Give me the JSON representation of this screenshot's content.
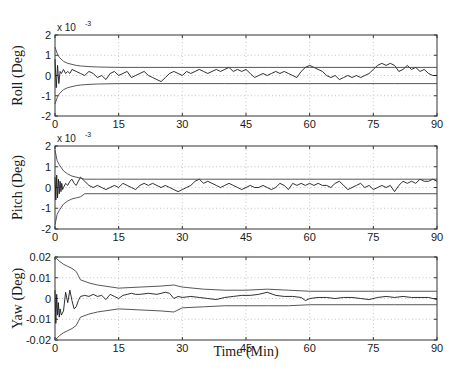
{
  "chart_data": {
    "type": "line",
    "title": "",
    "xlabel": "Time (Min)",
    "xlim": [
      0,
      90
    ],
    "xticks": [
      0,
      15,
      30,
      45,
      60,
      75,
      90
    ],
    "xtick_labels": [
      "0",
      "15",
      "30",
      "45",
      "60",
      "75",
      "90"
    ],
    "grid": true,
    "subplots": [
      {
        "name": "roll",
        "ylabel": "Roll (Deg)",
        "ylim": [
          -0.002,
          0.002
        ],
        "yticks": [
          -0.002,
          -0.001,
          0,
          0.001,
          0.002
        ],
        "ytick_labels": [
          "-2",
          "-1",
          "0",
          "1",
          "2"
        ],
        "exponent_label": "x 10",
        "exponent_power": "-3",
        "series": [
          {
            "name": "estimation error",
            "x": [
              0,
              0.3,
              0.6,
              0.9,
              1.2,
              1.5,
              2,
              2.5,
              3,
              3.5,
              4,
              5,
              6,
              7,
              8,
              9,
              10,
              11,
              12,
              13,
              14,
              15,
              16,
              17,
              18,
              19,
              20,
              21,
              22,
              23,
              24,
              25,
              26,
              27,
              28,
              29,
              30,
              31,
              32,
              33,
              34,
              35,
              36,
              37,
              38,
              39,
              40,
              41,
              42,
              43,
              44,
              45,
              46,
              47,
              48,
              49,
              50,
              51,
              52,
              53,
              54,
              55,
              56,
              57,
              58,
              59,
              60,
              61,
              62,
              63,
              64,
              65,
              66,
              67,
              68,
              69,
              70,
              71,
              72,
              73,
              74,
              75,
              76,
              77,
              78,
              79,
              80,
              81,
              82,
              83,
              84,
              85,
              86,
              87,
              88,
              89,
              90
            ],
            "y": [
              0.0008,
              -0.0006,
              0.0005,
              -0.0004,
              0.0002,
              0.0001,
              0.0003,
              0.0001,
              0.0002,
              0.0001,
              0.0003,
              0.0002,
              0.0001,
              0.0,
              0.0002,
              0.0001,
              -0.0001,
              0.0,
              -0.0002,
              0.0001,
              0.0002,
              0.0,
              0.0001,
              0.0002,
              -0.0001,
              0.0,
              0.0001,
              0.0002,
              0.0,
              -0.0001,
              -0.0002,
              -0.0003,
              -0.0001,
              0.0001,
              0.0002,
              0.0001,
              0.0,
              0.0002,
              0.0001,
              0.0002,
              0.0003,
              0.0002,
              0.0001,
              0.0002,
              0.0003,
              0.0002,
              0.0003,
              0.0004,
              0.0002,
              0.0003,
              0.0002,
              0.0003,
              0.0001,
              -0.0001,
              0.0,
              0.0001,
              0.0,
              0.0001,
              0.0002,
              0.0001,
              0.0002,
              0.0001,
              0.0,
              -0.0001,
              0.0002,
              0.0004,
              0.0005,
              0.0004,
              0.0003,
              0.0002,
              0.0,
              -0.0001,
              0.0,
              -0.0002,
              -0.0001,
              0.0,
              -0.0001,
              0.0,
              -0.0001,
              0.0,
              0.0001,
              0.0003,
              0.0005,
              0.0006,
              0.0005,
              0.0006,
              0.0005,
              0.0002,
              0.0003,
              0.0005,
              0.0003,
              0.0004,
              0.0002,
              0.0003,
              0.0001,
              0.0,
              0.0
            ]
          },
          {
            "name": "upper bound",
            "x": [
              0,
              0.5,
              1,
              2,
              3,
              4,
              5,
              6,
              8,
              10,
              15,
              20,
              30,
              40,
              50,
              60,
              70,
              80,
              90
            ],
            "y": [
              0.0014,
              0.0011,
              0.0009,
              0.0007,
              0.0006,
              0.00055,
              0.0005,
              0.00047,
              0.00044,
              0.00042,
              0.0004,
              0.0004,
              0.0004,
              0.0004,
              0.0004,
              0.0004,
              0.0004,
              0.0004,
              0.0004
            ]
          },
          {
            "name": "lower bound",
            "x": [
              0,
              0.5,
              1,
              2,
              3,
              4,
              5,
              6,
              8,
              10,
              15,
              20,
              30,
              40,
              50,
              60,
              70,
              80,
              90
            ],
            "y": [
              -0.0014,
              -0.0011,
              -0.0009,
              -0.0007,
              -0.0006,
              -0.00055,
              -0.0005,
              -0.00047,
              -0.00044,
              -0.00042,
              -0.0004,
              -0.0004,
              -0.0004,
              -0.0004,
              -0.0004,
              -0.0004,
              -0.0004,
              -0.0004,
              -0.0004
            ]
          }
        ]
      },
      {
        "name": "pitch",
        "ylabel": "Pitch (Deg)",
        "ylim": [
          -0.002,
          0.002
        ],
        "yticks": [
          -0.002,
          -0.001,
          0,
          0.001,
          0.002
        ],
        "ytick_labels": [
          "-2",
          "-1",
          "0",
          "1",
          "2"
        ],
        "exponent_label": "x 10",
        "exponent_power": "-3",
        "series": [
          {
            "name": "estimation error",
            "x": [
              0,
              0.2,
              0.4,
              0.6,
              0.8,
              1.0,
              1.2,
              1.4,
              1.6,
              1.8,
              2,
              2.5,
              3,
              3.5,
              4,
              4.5,
              5,
              5.5,
              6,
              7,
              8,
              9,
              10,
              11,
              12,
              13,
              14,
              15,
              16,
              17,
              18,
              19,
              20,
              21,
              22,
              23,
              24,
              25,
              26,
              27,
              28,
              29,
              30,
              31,
              32,
              33,
              34,
              35,
              36,
              37,
              38,
              39,
              40,
              41,
              42,
              43,
              44,
              45,
              46,
              47,
              48,
              49,
              50,
              51,
              52,
              53,
              54,
              55,
              56,
              57,
              58,
              59,
              60,
              61,
              62,
              63,
              64,
              65,
              66,
              67,
              68,
              69,
              70,
              71,
              72,
              73,
              74,
              75,
              76,
              77,
              78,
              79,
              80,
              81,
              82,
              83,
              84,
              85,
              86,
              87,
              88,
              89,
              90
            ],
            "y": [
              0.0005,
              -0.0006,
              0.0006,
              -0.0005,
              0.0004,
              -0.0003,
              0.0003,
              -0.0002,
              0.0002,
              -0.0001,
              0.0,
              0.0002,
              0.0001,
              0.0003,
              0.0004,
              0.0002,
              0.0001,
              0.0003,
              0.0005,
              0.0003,
              0.0001,
              0.0,
              0.0001,
              0.0,
              -0.0001,
              0.0,
              0.0001,
              0.0,
              0.0002,
              0.0001,
              0.0,
              -0.0001,
              0.0001,
              0.0002,
              0.0001,
              0.0002,
              0.0001,
              0.0,
              0.0001,
              0.0,
              -0.0001,
              -0.0002,
              -0.0001,
              0.0,
              0.0001,
              0.0003,
              0.0004,
              0.0002,
              0.0003,
              0.0002,
              0.0001,
              0.0,
              0.0001,
              0.0002,
              0.0001,
              0.0,
              -0.0001,
              0.0,
              0.0001,
              0.0,
              0.0,
              0.0001,
              0.0,
              -0.0001,
              0.0,
              0.0002,
              0.0001,
              -0.0001,
              0.0002,
              0.0001,
              0.0002,
              0.0001,
              0.0002,
              0.0001,
              0.0002,
              0.0001,
              0.0001,
              0.0,
              0.0002,
              0.0003,
              0.0001,
              -0.0001,
              0.0,
              0.0001,
              0.0002,
              0.0,
              0.0001,
              -0.0001,
              0.0,
              0.0001,
              0.0,
              0.0001,
              -0.0002,
              0.0001,
              0.0003,
              0.0002,
              0.0003,
              0.0002,
              0.0004,
              0.0003,
              0.0003,
              0.0004,
              0.0003
            ]
          },
          {
            "name": "upper bound",
            "x": [
              0,
              0.5,
              1,
              2,
              3,
              4,
              5,
              6,
              7,
              8,
              10,
              15,
              20,
              30,
              40,
              50,
              60,
              70,
              80,
              90
            ],
            "y": [
              0.0018,
              0.0013,
              0.0011,
              0.0008,
              0.00065,
              0.00055,
              0.0005,
              0.00045,
              0.0004,
              0.0004,
              0.0004,
              0.0004,
              0.0004,
              0.0004,
              0.0004,
              0.0004,
              0.0004,
              0.0004,
              0.0004,
              0.0004
            ]
          },
          {
            "name": "lower bound",
            "x": [
              0,
              0.5,
              1,
              2,
              3,
              4,
              5,
              6,
              7,
              8,
              10,
              15,
              20,
              30,
              40,
              50,
              60,
              70,
              80,
              90
            ],
            "y": [
              -0.0018,
              -0.0013,
              -0.0011,
              -0.0008,
              -0.00065,
              -0.00055,
              -0.0005,
              -0.00045,
              -0.0003,
              -0.0003,
              -0.0003,
              -0.0003,
              -0.0003,
              -0.0003,
              -0.0003,
              -0.0003,
              -0.0003,
              -0.0003,
              -0.0003,
              -0.0003
            ]
          }
        ]
      },
      {
        "name": "yaw",
        "ylabel": "Yaw (Deg)",
        "ylim": [
          -0.02,
          0.02
        ],
        "yticks": [
          -0.02,
          -0.01,
          0,
          0.01,
          0.02
        ],
        "ytick_labels": [
          "-0.02",
          "-0.01",
          "0",
          "0.01",
          "0.02"
        ],
        "exponent_label": "",
        "exponent_power": "",
        "series": [
          {
            "name": "estimation error",
            "x": [
              0,
              0.2,
              0.4,
              0.6,
              0.8,
              1.0,
              1.2,
              1.5,
              2,
              2.5,
              3,
              3.5,
              4,
              4.5,
              5,
              5.5,
              6,
              7,
              8,
              9,
              10,
              11,
              12,
              13,
              14,
              15,
              16,
              17,
              18,
              19,
              20,
              22,
              24,
              26,
              27,
              28,
              29,
              30,
              32,
              34,
              36,
              38,
              40,
              42,
              44,
              46,
              48,
              50,
              52,
              54,
              56,
              58,
              59,
              60,
              62,
              64,
              66,
              68,
              70,
              72,
              74,
              76,
              78,
              80,
              82,
              84,
              86,
              88,
              90
            ],
            "y": [
              0.004,
              -0.012,
              0.002,
              -0.008,
              -0.002,
              -0.009,
              -0.005,
              -0.008,
              -0.006,
              0.003,
              -0.002,
              0.004,
              -0.001,
              -0.005,
              -0.004,
              -0.001,
              0.001,
              0.0015,
              0.001,
              0.002,
              0.001,
              0.0015,
              -0.0005,
              0.002,
              0.001,
              0.0,
              0.0015,
              0.002,
              0.0025,
              0.002,
              0.002,
              0.0025,
              0.002,
              0.003,
              0.0025,
              0.0,
              0.001,
              0.0005,
              0.001,
              0.0005,
              0.0,
              -0.0005,
              0.0005,
              0.001,
              0.0015,
              0.0015,
              0.002,
              0.003,
              0.0015,
              0.001,
              0.001,
              0.0005,
              -0.001,
              0.0,
              0.0005,
              0.0005,
              0.0,
              0.0005,
              0.0005,
              0.0,
              -0.0005,
              0.0005,
              0.001,
              0.0005,
              0.001,
              0.0005,
              0.0005,
              0.0005,
              -0.0005
            ]
          },
          {
            "name": "upper bound",
            "x": [
              0,
              1,
              2,
              3,
              4,
              5,
              5.5,
              6,
              8,
              10,
              15,
              20,
              25,
              28,
              30,
              35,
              40,
              45,
              50,
              55,
              60,
              70,
              80,
              90
            ],
            "y": [
              0.02,
              0.018,
              0.0165,
              0.0155,
              0.0145,
              0.013,
              0.011,
              0.009,
              0.0075,
              0.0065,
              0.005,
              0.0055,
              0.006,
              0.0065,
              0.0055,
              0.0045,
              0.004,
              0.004,
              0.0045,
              0.004,
              0.0035,
              0.0035,
              0.0035,
              0.0035
            ]
          },
          {
            "name": "lower bound",
            "x": [
              0,
              1,
              2,
              3,
              4,
              5,
              5.5,
              6,
              8,
              10,
              15,
              20,
              25,
              28,
              30,
              35,
              40,
              45,
              50,
              55,
              60,
              70,
              80,
              90
            ],
            "y": [
              -0.02,
              -0.018,
              -0.0165,
              -0.0155,
              -0.0145,
              -0.013,
              -0.011,
              -0.009,
              -0.0075,
              -0.0065,
              -0.005,
              -0.0055,
              -0.006,
              -0.0065,
              -0.0045,
              -0.004,
              -0.0035,
              -0.0035,
              -0.0035,
              -0.0035,
              -0.003,
              -0.003,
              -0.003,
              -0.003
            ]
          }
        ]
      }
    ]
  }
}
